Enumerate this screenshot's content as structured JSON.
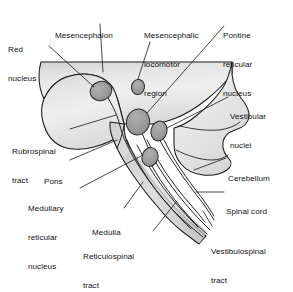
{
  "figure": {
    "type": "anatomical-diagram",
    "width": 293,
    "height": 266,
    "background_color": "#ffffff"
  },
  "palette": {
    "outline": "#1a1a1a",
    "brain_fill_light": "#f0f0f0",
    "brain_fill_mid": "#e2e2e2",
    "brain_fill_dark": "#cfcfcf",
    "nucleus_fill": "#9a9a9a",
    "nucleus_outline": "#2a2a2a",
    "leader_line": "#1a1a1a",
    "tract_line": "#1a1a1a",
    "label_text": "#111111"
  },
  "labels": [
    {
      "id": "red-nucleus",
      "text": "Red\nnucleus",
      "lines": [
        "Red",
        "nucleus"
      ],
      "x": 8,
      "y": 26,
      "align": "left"
    },
    {
      "id": "mesencephalon",
      "text": "Mesencephalon",
      "lines": [
        "Mesencephalon"
      ],
      "x": 55,
      "y": 12,
      "align": "left"
    },
    {
      "id": "mesencephalic-locomotor-region",
      "text": "Mesencephalic\nlocomotor\nregion",
      "lines": [
        "Mesencephalic",
        "locomotor",
        "region"
      ],
      "x": 144,
      "y": 12,
      "align": "left"
    },
    {
      "id": "pontine-reticular-nucleus",
      "text": "Pontine\nreticular\nnucleus",
      "lines": [
        "Pontine",
        "reticular",
        "nucleus"
      ],
      "x": 223,
      "y": 12,
      "align": "left"
    },
    {
      "id": "vestibular-nuclei",
      "text": "Vestibular\nnuclei",
      "lines": [
        "Vestibular",
        "nuclei"
      ],
      "x": 230,
      "y": 93,
      "align": "left"
    },
    {
      "id": "cerebellum",
      "text": "Cerebellum",
      "lines": [
        "Cerebellum"
      ],
      "x": 228,
      "y": 155,
      "align": "left"
    },
    {
      "id": "spinal-cord",
      "text": "Spinal cord",
      "lines": [
        "Spinal cord"
      ],
      "x": 226,
      "y": 188,
      "align": "left"
    },
    {
      "id": "vestibulospinal-tract",
      "text": "Vestibulospinal\ntract",
      "lines": [
        "Vestibulospinal",
        "tract"
      ],
      "x": 211,
      "y": 228,
      "align": "left"
    },
    {
      "id": "rubrospinal-tract",
      "text": "Rubrospinal\ntract",
      "lines": [
        "Rubrospinal",
        "tract"
      ],
      "x": 12,
      "y": 128,
      "align": "left"
    },
    {
      "id": "pons",
      "text": "Pons",
      "lines": [
        "Pons"
      ],
      "x": 44,
      "y": 158,
      "align": "left"
    },
    {
      "id": "medullary-reticular-nucleus",
      "text": "Medullary\nreticular\nnucleus",
      "lines": [
        "Medullary",
        "reticular",
        "nucleus"
      ],
      "x": 28,
      "y": 185,
      "align": "left"
    },
    {
      "id": "medulla",
      "text": "Medulla",
      "lines": [
        "Medulla"
      ],
      "x": 92,
      "y": 209,
      "align": "left"
    },
    {
      "id": "reticulospinal-tract",
      "text": "Reticulospinal\ntract",
      "lines": [
        "Reticulospinal",
        "tract"
      ],
      "x": 83,
      "y": 233,
      "align": "left"
    }
  ],
  "structures": [
    {
      "id": "cerebrum-block",
      "name": "mesencephalon-block",
      "fill": "#e6e6e6"
    },
    {
      "id": "cerebellum-body",
      "name": "cerebellum",
      "fill": "#e0e0e0"
    },
    {
      "id": "brainstem-column",
      "name": "brainstem",
      "fill": "#dddddd"
    },
    {
      "id": "spinal-cord-column",
      "name": "spinal-cord",
      "fill": "#d8d8d8"
    }
  ],
  "nuclei": [
    {
      "id": "red-nucleus-mark",
      "label": "Red nucleus",
      "cx": 101,
      "cy": 91,
      "rx": 11,
      "ry": 9.5,
      "rot": -18
    },
    {
      "id": "mlr-mark",
      "label": "Mesencephalic locomotor region",
      "cx": 138,
      "cy": 87,
      "rx": 6.5,
      "ry": 7.5,
      "rot": 10
    },
    {
      "id": "pontine-reticular-mark",
      "label": "Pontine reticular nucleus",
      "cx": 138,
      "cy": 122,
      "rx": 11.5,
      "ry": 13,
      "rot": 12
    },
    {
      "id": "vestibular-mark",
      "label": "Vestibular nuclei",
      "cx": 159,
      "cy": 131,
      "rx": 8,
      "ry": 10,
      "rot": 14
    },
    {
      "id": "medullary-reticular-mark",
      "label": "Medullary reticular nucleus",
      "cx": 150,
      "cy": 157,
      "rx": 8,
      "ry": 9.5,
      "rot": 16
    }
  ],
  "tracts": [
    {
      "id": "rubrospinal",
      "label": "Rubrospinal tract",
      "origin": "Red nucleus"
    },
    {
      "id": "reticulospinal-pontine",
      "label": "Reticulospinal tract",
      "origin": "Pontine reticular nucleus"
    },
    {
      "id": "reticulospinal-medullary",
      "label": "Reticulospinal tract",
      "origin": "Medullary reticular nucleus"
    },
    {
      "id": "vestibulospinal",
      "label": "Vestibulospinal tract",
      "origin": "Vestibular nuclei"
    }
  ]
}
